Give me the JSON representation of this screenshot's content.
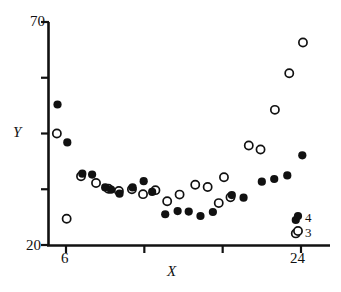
{
  "chart_data": {
    "type": "scatter",
    "title": "",
    "xlabel": "X",
    "ylabel": "Y",
    "xlim": [
      5.0,
      25.1
    ],
    "ylim": [
      20,
      71.6
    ],
    "grid": false,
    "x_ticks": [
      6,
      12,
      18,
      24
    ],
    "x_tick_labels": [
      "6",
      "",
      "",
      "24"
    ],
    "y_ticks": [
      20,
      32.5,
      45,
      57.5,
      70
    ],
    "y_tick_labels": [
      "20",
      "",
      "",
      "",
      "70"
    ],
    "legend_position": "bottom-right",
    "series": [
      {
        "name": "4",
        "marker": "filled-circle",
        "color": "#111111",
        "points": [
          {
            "x": 5.35,
            "y": 51.5
          },
          {
            "x": 6.1,
            "y": 43.0
          },
          {
            "x": 7.25,
            "y": 36.0
          },
          {
            "x": 8.0,
            "y": 35.8
          },
          {
            "x": 9.0,
            "y": 32.9
          },
          {
            "x": 9.45,
            "y": 32.4
          },
          {
            "x": 10.1,
            "y": 31.5
          },
          {
            "x": 11.1,
            "y": 32.9
          },
          {
            "x": 11.95,
            "y": 34.3
          },
          {
            "x": 12.6,
            "y": 31.9
          },
          {
            "x": 13.6,
            "y": 26.9
          },
          {
            "x": 14.55,
            "y": 27.6
          },
          {
            "x": 15.4,
            "y": 27.5
          },
          {
            "x": 16.3,
            "y": 26.5
          },
          {
            "x": 17.25,
            "y": 27.4
          },
          {
            "x": 18.7,
            "y": 31.2
          },
          {
            "x": 19.6,
            "y": 30.6
          },
          {
            "x": 21.0,
            "y": 34.2
          },
          {
            "x": 21.95,
            "y": 34.8
          },
          {
            "x": 22.95,
            "y": 35.6
          },
          {
            "x": 24.1,
            "y": 40.1
          },
          {
            "x": 23.6,
            "y": 25.6
          }
        ]
      },
      {
        "name": "3",
        "marker": "open-circle",
        "color": "#111111",
        "points": [
          {
            "x": 5.3,
            "y": 45.0
          },
          {
            "x": 6.05,
            "y": 25.9
          },
          {
            "x": 7.15,
            "y": 35.4
          },
          {
            "x": 8.3,
            "y": 33.9
          },
          {
            "x": 9.25,
            "y": 32.6
          },
          {
            "x": 10.05,
            "y": 32.1
          },
          {
            "x": 11.05,
            "y": 32.5
          },
          {
            "x": 11.9,
            "y": 31.4
          },
          {
            "x": 12.85,
            "y": 32.3
          },
          {
            "x": 13.75,
            "y": 29.8
          },
          {
            "x": 14.7,
            "y": 31.3
          },
          {
            "x": 15.9,
            "y": 33.5
          },
          {
            "x": 16.85,
            "y": 33.0
          },
          {
            "x": 17.7,
            "y": 29.4
          },
          {
            "x": 18.1,
            "y": 35.2
          },
          {
            "x": 18.6,
            "y": 30.7
          },
          {
            "x": 20.0,
            "y": 42.3
          },
          {
            "x": 20.9,
            "y": 41.4
          },
          {
            "x": 22.0,
            "y": 50.3
          },
          {
            "x": 23.1,
            "y": 58.5
          },
          {
            "x": 24.15,
            "y": 65.4
          },
          {
            "x": 23.6,
            "y": 22.6
          }
        ]
      }
    ],
    "legend": [
      {
        "label": "4",
        "marker": "filled-circle"
      },
      {
        "label": "3",
        "marker": "open-circle"
      }
    ]
  },
  "axes": {
    "y_top_label": "70",
    "y_bottom_label": "20",
    "x_left_label": "6",
    "x_right_label": "24",
    "x_title": "X",
    "y_title": "Y"
  },
  "legend": {
    "filled_label": "4",
    "open_label": "3"
  }
}
